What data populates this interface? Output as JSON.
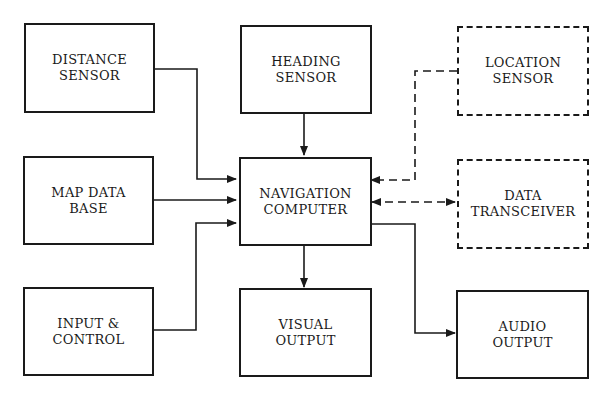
{
  "diagram": {
    "type": "block-diagram",
    "nodes": {
      "distance_sensor": {
        "label": "DISTANCE\nSENSOR",
        "style": "solid"
      },
      "heading_sensor": {
        "label": "HEADING\nSENSOR",
        "style": "solid"
      },
      "location_sensor": {
        "label": "LOCATION\nSENSOR",
        "style": "dashed"
      },
      "map_data_base": {
        "label": "MAP DATA\nBASE",
        "style": "solid"
      },
      "navigation_computer": {
        "label": "NAVIGATION\nCOMPUTER",
        "style": "solid"
      },
      "data_transceiver": {
        "label": "DATA\nTRANSCEIVER",
        "style": "dashed"
      },
      "input_control": {
        "label": "INPUT &\nCONTROL",
        "style": "solid"
      },
      "visual_output": {
        "label": "VISUAL\nOUTPUT",
        "style": "solid"
      },
      "audio_output": {
        "label": "AUDIO\nOUTPUT",
        "style": "solid"
      }
    },
    "edges": [
      {
        "from": "DISTANCE SENSOR",
        "to": "NAVIGATION COMPUTER",
        "style": "solid",
        "direction": "one-way"
      },
      {
        "from": "HEADING SENSOR",
        "to": "NAVIGATION COMPUTER",
        "style": "solid",
        "direction": "one-way"
      },
      {
        "from": "LOCATION SENSOR",
        "to": "NAVIGATION COMPUTER",
        "style": "dashed",
        "direction": "one-way"
      },
      {
        "from": "MAP DATA BASE",
        "to": "NAVIGATION COMPUTER",
        "style": "solid",
        "direction": "one-way"
      },
      {
        "from": "NAVIGATION COMPUTER",
        "to": "DATA TRANSCEIVER",
        "style": "dashed",
        "direction": "two-way"
      },
      {
        "from": "INPUT & CONTROL",
        "to": "NAVIGATION COMPUTER",
        "style": "solid",
        "direction": "one-way"
      },
      {
        "from": "NAVIGATION COMPUTER",
        "to": "VISUAL OUTPUT",
        "style": "solid",
        "direction": "one-way"
      },
      {
        "from": "NAVIGATION COMPUTER",
        "to": "AUDIO OUTPUT",
        "style": "solid",
        "direction": "one-way"
      }
    ],
    "colors": {
      "line": "#1a1a1a",
      "background": "#ffffff"
    }
  }
}
